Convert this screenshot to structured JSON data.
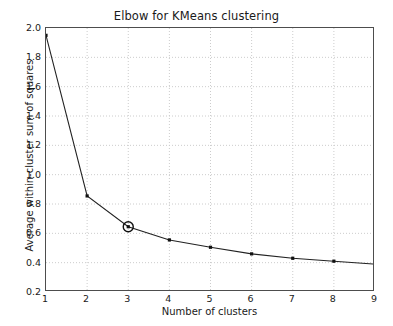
{
  "chart_data": {
    "type": "line",
    "title": "Elbow for KMeans clustering",
    "xlabel": "Number of clusters",
    "ylabel": "Average within-cluster sum of squares",
    "x": [
      1,
      2,
      3,
      4,
      5,
      6,
      7,
      8,
      9
    ],
    "values": [
      1.95,
      0.855,
      0.645,
      0.555,
      0.505,
      0.46,
      0.43,
      0.41,
      0.39
    ],
    "series": [
      {
        "name": "Average within-cluster sum of squares",
        "values": [
          1.95,
          0.855,
          0.645,
          0.555,
          0.505,
          0.46,
          0.43,
          0.41,
          0.39
        ]
      }
    ],
    "xlim": [
      1,
      9
    ],
    "ylim": [
      0.2,
      2.0
    ],
    "xticks": [
      "1",
      "2",
      "3",
      "4",
      "5",
      "6",
      "7",
      "8",
      "9"
    ],
    "yticks": [
      "0.2",
      "0.4",
      "0.6",
      "0.8",
      "1.0",
      "1.2",
      "1.4",
      "1.6",
      "1.8",
      "2.0"
    ],
    "ytick_values": [
      0.2,
      0.4,
      0.6,
      0.8,
      1.0,
      1.2,
      1.4,
      1.6,
      1.8,
      2.0
    ],
    "grid": true,
    "grid_style": "dotted",
    "legend": null,
    "annotations": [
      {
        "type": "circle-marker",
        "label": "elbow",
        "x": 3,
        "y": 0.645
      }
    ],
    "line_color": "#222222",
    "marker": "square",
    "marker_color": "#111111",
    "grid_color": "#cccccc",
    "axis_color": "#4d4d4d",
    "background": "#ffffff"
  }
}
